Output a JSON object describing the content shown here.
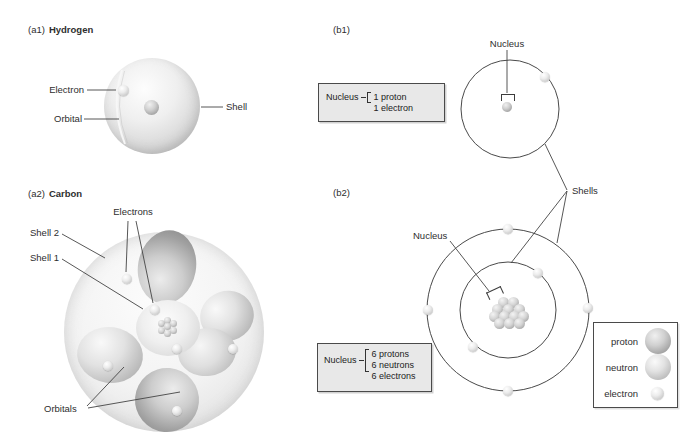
{
  "figure": {
    "a1": {
      "tag": "(a1)",
      "title": "Hydrogen",
      "electron_label": "Electron",
      "orbital_label": "Orbital",
      "shell_label": "Shell"
    },
    "a2": {
      "tag": "(a2)",
      "title": "Carbon",
      "electrons_label": "Electrons",
      "shell2_label": "Shell 2",
      "shell1_label": "Shell 1",
      "orbitals_label": "Orbitals"
    },
    "b1": {
      "tag": "(b1)",
      "nucleus_label": "Nucleus",
      "box": {
        "label": "Nucleus",
        "lines": [
          "1 proton",
          "1 electron"
        ]
      }
    },
    "b2": {
      "tag": "(b2)",
      "nucleus_label": "Nucleus",
      "box": {
        "label": "Nucleus",
        "lines": [
          "6 protons",
          "6 neutrons",
          "6 electrons"
        ]
      }
    },
    "shells_label": "Shells",
    "legend": {
      "items": [
        "proton",
        "neutron",
        "electron"
      ]
    },
    "colors": {
      "line": "#444444",
      "circle_stroke": "#4a4a4a",
      "box_fill": "#e8e8e8",
      "box_border": "#4a4a4a",
      "text": "#2e2e2e"
    }
  }
}
